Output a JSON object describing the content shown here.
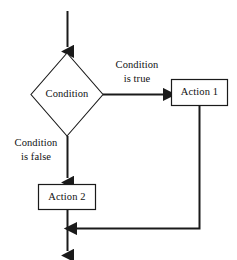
{
  "diagram": {
    "type": "flowchart",
    "background_color": "#ffffff",
    "stroke_color": "#1a1a1a",
    "text_color": "#111111",
    "nodes": [
      {
        "id": "condition",
        "shape": "diamond",
        "label": "Condition"
      },
      {
        "id": "action1",
        "shape": "rectangle",
        "label": "Action 1"
      },
      {
        "id": "action2",
        "shape": "rectangle",
        "label": "Action 2"
      }
    ],
    "edge_labels": {
      "true_branch_line1": "Condition",
      "true_branch_line2": "is true",
      "false_branch_line1": "Condition",
      "false_branch_line2": "is false"
    }
  }
}
